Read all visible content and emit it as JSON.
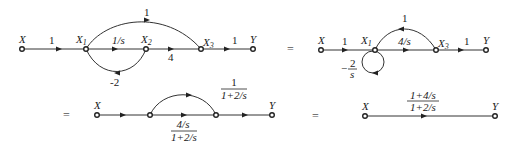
{
  "diagram": {
    "graph1": {
      "nodes": [
        {
          "id": "X",
          "label": "X",
          "sub": "",
          "x": 22,
          "y": 49
        },
        {
          "id": "X1",
          "label": "X",
          "sub": "1",
          "x": 86,
          "y": 49
        },
        {
          "id": "X2",
          "label": "X",
          "sub": "2",
          "x": 146,
          "y": 49
        },
        {
          "id": "X3",
          "label": "X",
          "sub": "3",
          "x": 201,
          "y": 49
        },
        {
          "id": "Y",
          "label": "Y",
          "sub": "",
          "x": 253,
          "y": 49
        }
      ],
      "edges": [
        {
          "from": "X",
          "to": "X1",
          "gain": "1"
        },
        {
          "from": "X1",
          "to": "X2",
          "gain": "1/s"
        },
        {
          "from": "X2",
          "to": "X3",
          "gain": "4"
        },
        {
          "from": "X3",
          "to": "Y",
          "gain": "1"
        },
        {
          "from": "X1",
          "to": "X3",
          "gain": "1",
          "type": "feedforward-arc"
        },
        {
          "from": "X2",
          "to": "X1",
          "gain": "-2",
          "type": "feedback-arc"
        }
      ]
    },
    "eq1": "=",
    "graph2": {
      "nodes": [
        {
          "id": "X",
          "label": "X",
          "sub": "",
          "x": 321,
          "y": 50
        },
        {
          "id": "X1",
          "label": "X",
          "sub": "1",
          "x": 375,
          "y": 50
        },
        {
          "id": "X3",
          "label": "X",
          "sub": "3",
          "x": 436,
          "y": 50
        },
        {
          "id": "Y",
          "label": "Y",
          "sub": "",
          "x": 486,
          "y": 50
        }
      ],
      "edges": [
        {
          "from": "X",
          "to": "X1",
          "gain": "1"
        },
        {
          "from": "X1",
          "to": "X3",
          "gain": "4/s"
        },
        {
          "from": "X3",
          "to": "Y",
          "gain": "1"
        },
        {
          "from": "X1",
          "to": "X3",
          "gain": "1",
          "type": "feedforward-arc"
        },
        {
          "from": "X1",
          "to": "X1",
          "gain_num": "2",
          "gain_den": "s",
          "gain_sign": "−",
          "type": "self-loop"
        }
      ]
    },
    "eq2": "=",
    "graph3": {
      "nodes": [
        {
          "id": "X",
          "label": "X",
          "x": 97,
          "y": 115
        },
        {
          "id": "N1",
          "label": "",
          "x": 150,
          "y": 115
        },
        {
          "id": "N2",
          "label": "",
          "x": 216,
          "y": 115
        },
        {
          "id": "Y",
          "label": "Y",
          "x": 272,
          "y": 115
        }
      ],
      "edges": [
        {
          "from": "X",
          "to": "N1",
          "gain": ""
        },
        {
          "from": "N1",
          "to": "N2",
          "gain_num": "4/s",
          "gain_den": "1+2/s"
        },
        {
          "from": "N2",
          "to": "Y",
          "gain": ""
        },
        {
          "from": "N1",
          "to": "N2",
          "gain_num": "1",
          "gain_den": "1+2/s",
          "type": "feedforward-arc"
        }
      ]
    },
    "eq3": "=",
    "graph4": {
      "nodes": [
        {
          "id": "X",
          "label": "X",
          "x": 365,
          "y": 116
        },
        {
          "id": "Y",
          "label": "Y",
          "x": 495,
          "y": 116
        }
      ],
      "edges": [
        {
          "from": "X",
          "to": "Y",
          "gain_num": "1+4/s",
          "gain_den": "1+2/s"
        }
      ]
    }
  }
}
